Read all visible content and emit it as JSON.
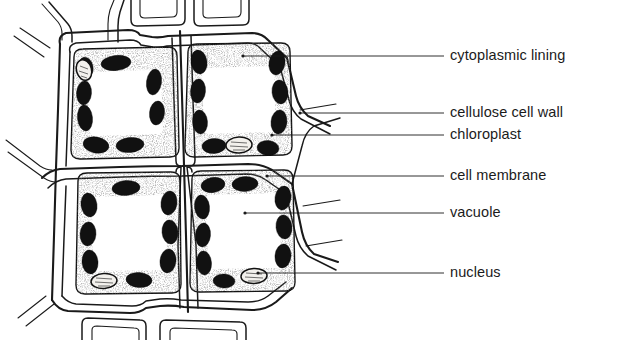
{
  "figure": {
    "background_color": "#ffffff",
    "ink_color": "#1a1a1a",
    "chloroplast_color": "#111111",
    "nucleus_color": "#f2f0ec",
    "cytoplasm_stipple_color": "#3a3a3a",
    "vacuole_color": "#ffffff"
  },
  "labels": [
    {
      "id": "cytoplasmic-lining",
      "text": "cytoplasmic lining",
      "text_x": 450,
      "text_y": 56,
      "leader_from_x": 444,
      "leader_to_x": 243,
      "target_x": 243,
      "target_y": 56
    },
    {
      "id": "cellulose-cell-wall",
      "text": "cellulose cell wall",
      "text_x": 450,
      "text_y": 113,
      "leader_from_x": 444,
      "leader_to_x": 300,
      "target_x": 300,
      "target_y": 113
    },
    {
      "id": "chloroplast",
      "text": "chloroplast",
      "text_x": 450,
      "text_y": 135,
      "leader_from_x": 444,
      "leader_to_x": 272,
      "target_x": 272,
      "target_y": 135
    },
    {
      "id": "cell-membrane",
      "text": "cell membrane",
      "text_x": 450,
      "text_y": 176,
      "leader_from_x": 444,
      "leader_to_x": 267,
      "target_x": 267,
      "target_y": 176
    },
    {
      "id": "vacuole",
      "text": "vacuole",
      "text_x": 450,
      "text_y": 213,
      "leader_from_x": 444,
      "leader_to_x": 245,
      "target_x": 245,
      "target_y": 213
    },
    {
      "id": "nucleus",
      "text": "nucleus",
      "text_x": 450,
      "text_y": 273,
      "leader_from_x": 444,
      "leader_to_x": 258,
      "target_x": 258,
      "target_y": 273
    }
  ],
  "cells": [
    {
      "id": "cell-top-left",
      "position": "top-left",
      "chloroplast_count": 8,
      "nucleus": {
        "present": true,
        "location": "upper-left"
      },
      "has_vacuole": true,
      "has_cytoplasmic_lining": true
    },
    {
      "id": "cell-top-right",
      "position": "top-right",
      "chloroplast_count": 8,
      "nucleus": {
        "present": true,
        "location": "bottom-center"
      },
      "has_vacuole": true,
      "has_cytoplasmic_lining": true
    },
    {
      "id": "cell-bottom-left",
      "position": "bottom-left",
      "chloroplast_count": 9,
      "nucleus": {
        "present": true,
        "location": "bottom-left"
      },
      "has_vacuole": true,
      "has_cytoplasmic_lining": true
    },
    {
      "id": "cell-bottom-right",
      "position": "bottom-right",
      "chloroplast_count": 9,
      "nucleus": {
        "present": true,
        "location": "bottom-right"
      },
      "has_vacuole": true,
      "has_cytoplasmic_lining": true
    }
  ],
  "partial_cells": {
    "top_edge_count": 3,
    "bottom_edge_count": 2,
    "left_edge_count": 2,
    "right_edge_count": 2
  }
}
